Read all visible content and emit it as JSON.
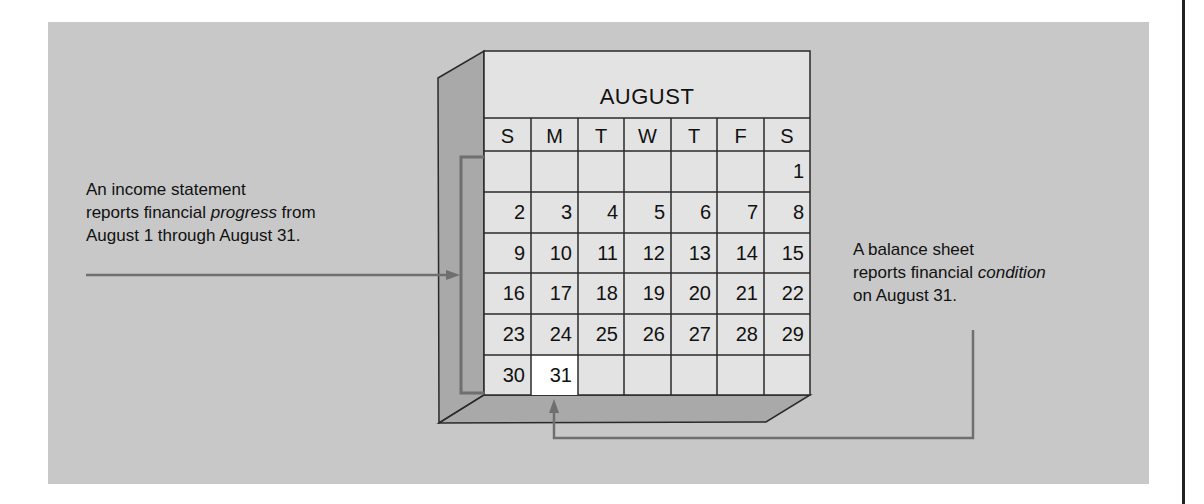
{
  "calendar": {
    "month": "AUGUST",
    "weekdays": [
      "S",
      "M",
      "T",
      "W",
      "T",
      "F",
      "S"
    ],
    "weeks": [
      [
        "",
        "",
        "",
        "",
        "",
        "",
        "1"
      ],
      [
        "2",
        "3",
        "4",
        "5",
        "6",
        "7",
        "8"
      ],
      [
        "9",
        "10",
        "11",
        "12",
        "13",
        "14",
        "15"
      ],
      [
        "16",
        "17",
        "18",
        "19",
        "20",
        "21",
        "22"
      ],
      [
        "23",
        "24",
        "25",
        "26",
        "27",
        "28",
        "29"
      ],
      [
        "30",
        "31",
        "",
        "",
        "",
        "",
        ""
      ]
    ],
    "highlighted_day": "31"
  },
  "income_statement": {
    "line1": "An income statement",
    "line2_pre": "reports financial ",
    "line2_em": "progress",
    "line2_post": " from",
    "line3": "August 1 through August 31."
  },
  "balance_sheet": {
    "line1": "A balance sheet",
    "line2_pre": "reports financial ",
    "line2_em": "condition",
    "line3": "on August 31."
  },
  "colors": {
    "panel": "#c8c8c8",
    "calendar_face": "#e3e3e3",
    "side_face": "#a9a9a9",
    "highlight": "#ffffff",
    "arrow": "#6f6f6f",
    "grid": "#2a2a2a"
  }
}
